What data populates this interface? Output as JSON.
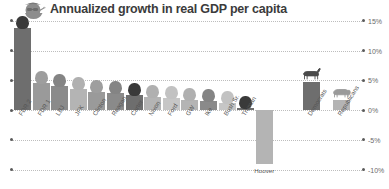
{
  "header": {
    "title": "Annualized growth in real GDP per capita",
    "icon": "fdr-portrait-icon"
  },
  "chart_data": {
    "type": "bar",
    "title": "Annualized growth in real GDP per capita",
    "xlabel": "",
    "ylabel": "",
    "ylim": [
      -10,
      15
    ],
    "grid": true,
    "legend": "none",
    "ytick_labels": [
      "15%",
      "10%",
      "5%",
      "0%",
      "-5%",
      "-10%"
    ],
    "ytick_values": [
      15,
      10,
      5,
      0,
      -5,
      -10
    ],
    "categories": [
      "FDR 2",
      "FDR 1",
      "LBJ",
      "JFK",
      "Clinton",
      "Reagan",
      "Carter",
      "Nixon",
      "Ford",
      "GW",
      "Ike",
      "Bush Sr.",
      "Truman",
      "Hoover"
    ],
    "values": [
      13.8,
      4.6,
      4.1,
      3.6,
      3.1,
      2.9,
      2.6,
      2.2,
      2.0,
      1.7,
      1.5,
      1.2,
      0.4,
      -9.0
    ],
    "summary_categories": [
      "Democrats",
      "Republicans"
    ],
    "summary_values": [
      4.7,
      1.6
    ],
    "summary_icons": [
      "donkey-icon",
      "elephant-icon"
    ]
  }
}
